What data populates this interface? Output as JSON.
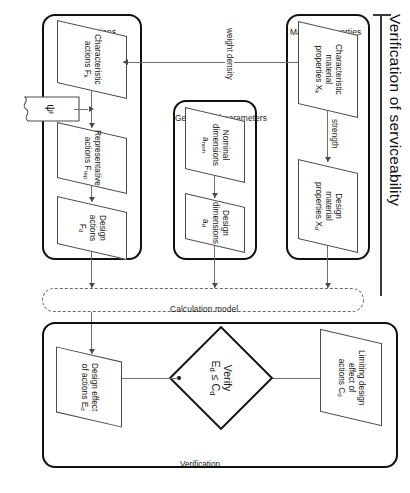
{
  "diagram": {
    "title": "Verification of serviceability",
    "orientation": "rotated-90",
    "groups": [
      {
        "id": "material",
        "label": "Material properties"
      },
      {
        "id": "geometrical",
        "label": "Geometrical parameters"
      },
      {
        "id": "actions",
        "label": "Actions"
      },
      {
        "id": "calculation_model",
        "label": "Calculation model"
      },
      {
        "id": "verification",
        "label": "Verification"
      }
    ],
    "nodes": [
      {
        "id": "char_material",
        "group": "material",
        "shape": "parallelogram",
        "line1": "Characteristic",
        "line2": "material",
        "line3": "properties X",
        "sub": "k"
      },
      {
        "id": "design_material",
        "group": "material",
        "shape": "parallelogram",
        "line1": "Design",
        "line2": "material",
        "line3": "properties X",
        "sub": "d"
      },
      {
        "id": "nominal_dim",
        "group": "geometrical",
        "shape": "parallelogram",
        "line1": "Nominal",
        "line2": "dimensions a",
        "line3": "",
        "sub": "nom"
      },
      {
        "id": "design_dim",
        "group": "geometrical",
        "shape": "parallelogram",
        "line1": "Design",
        "line2": "dimensions a",
        "line3": "",
        "sub": "d"
      },
      {
        "id": "char_actions",
        "group": "actions",
        "shape": "parallelogram",
        "line1": "Characteristic",
        "line2": "actions F",
        "line3": "",
        "sub": "k"
      },
      {
        "id": "rep_actions",
        "group": "actions",
        "shape": "parallelogram",
        "line1": "Representative",
        "line2": "actions F",
        "line3": "",
        "sub": "rep"
      },
      {
        "id": "design_actions",
        "group": "actions",
        "shape": "parallelogram",
        "line1": "Design actions",
        "line2": "F",
        "line3": "",
        "sub": "d"
      },
      {
        "id": "design_effect",
        "group": "verification",
        "shape": "parallelogram",
        "line1": "Design effect",
        "line2": "of actions E",
        "line3": "",
        "sub": "d"
      },
      {
        "id": "limiting",
        "group": "verification",
        "shape": "parallelogram",
        "line1": "Limiting design",
        "line2": "effect of",
        "line3": "actions C",
        "sub": "d"
      },
      {
        "id": "psi",
        "group": "actions",
        "shape": "document",
        "line1": "ψ",
        "line2": "",
        "line3": "",
        "sub": "i"
      }
    ],
    "decision": {
      "id": "verify",
      "shape": "diamond",
      "line1": "Verify",
      "line2": "E",
      "sub1": "d",
      "op": " ≤ C",
      "sub2": "d"
    },
    "edge_labels": [
      {
        "id": "strength",
        "text": "strength"
      },
      {
        "id": "weight_density",
        "text": "weight density"
      }
    ],
    "colors": {
      "stroke_dark": "#111111",
      "stroke_node": "#4b4b4b",
      "connector": "#6f6f6f",
      "dashed_group": "#6a6a6a",
      "background": "#ffffff"
    }
  }
}
